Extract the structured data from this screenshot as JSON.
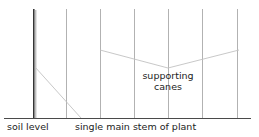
{
  "diagram": {
    "width": 259,
    "height": 137,
    "background_color": "#ffffff",
    "labels": {
      "soil_level": "soil level",
      "main_stem": "single main stem of plant",
      "supporting_canes_line1": "supporting",
      "supporting_canes_line2": "canes"
    },
    "colors": {
      "ground_line": "#4a4a4a",
      "main_stem": "#2b2b2b",
      "cane": "#a9a9a9",
      "leader_line": "#c2c2c2",
      "text": "#1c1c1c"
    },
    "geometry": {
      "ground_line": {
        "x1": 4,
        "y1": 118,
        "x2": 251,
        "y2": 118,
        "stroke_width": 1
      },
      "main_stem": {
        "x": 34,
        "y_top": 9,
        "y_bottom": 118,
        "stroke_width": 1.6
      },
      "main_stem_inner": {
        "x": 36,
        "y_top": 10,
        "y_bottom": 118,
        "stroke_width": 0.7
      },
      "canes_x": [
        66,
        100,
        134,
        168,
        202,
        237
      ],
      "cane_y_top": 9,
      "cane_y_bottom": 118,
      "cane_stroke_width": 0.9,
      "leader_main_stem": {
        "x1": 35,
        "y1": 67,
        "x2": 81,
        "y2": 118
      },
      "leader_canes_left": {
        "x1": 100,
        "y1": 50,
        "x2": 168,
        "y2": 68
      },
      "leader_canes_right": {
        "x1": 239,
        "y1": 50,
        "x2": 168,
        "y2": 68
      }
    }
  }
}
